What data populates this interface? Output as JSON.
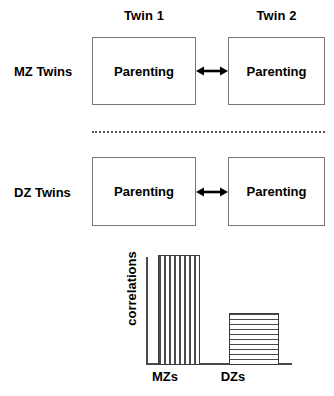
{
  "figure": {
    "column_headers": [
      {
        "id": "twin1",
        "label": "Twin 1"
      },
      {
        "id": "twin2",
        "label": "Twin 2"
      }
    ],
    "rows": [
      {
        "id": "mz",
        "row_label": "MZ Twins",
        "twin1_box_label": "Parenting",
        "twin2_box_label": "Parenting",
        "link": "double-headed-arrow"
      },
      {
        "id": "dz",
        "row_label": "DZ Twins",
        "twin1_box_label": "Parenting",
        "twin2_box_label": "Parenting",
        "link": "double-headed-arrow"
      }
    ],
    "divider": "dotted-separator",
    "colors": {
      "box_border": "#777777",
      "arrow": "#000000",
      "divider": "#555555",
      "axis": "#4a4a4a",
      "bar_stroke": "#3a3a3a",
      "bar_fill": "#ffffff",
      "text": "#000000",
      "background": "#ffffff"
    }
  },
  "chart_data": {
    "type": "bar",
    "title": "",
    "xlabel": "",
    "ylabel": "correlations",
    "categories": [
      "MZs",
      "DZs"
    ],
    "values": [
      1.0,
      0.47
    ],
    "ylim": [
      0,
      1.0
    ],
    "grid": false,
    "legend": false,
    "bar_patterns": [
      "vertical-stripes",
      "horizontal-stripes"
    ]
  }
}
